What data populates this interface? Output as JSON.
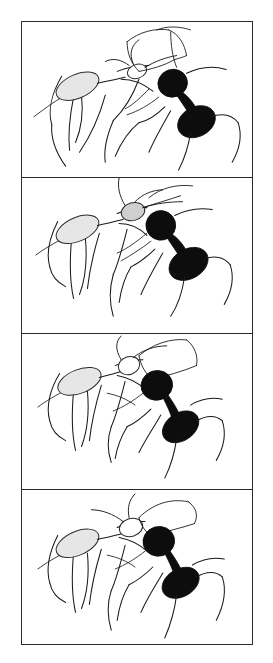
{
  "figure": {
    "caption": "",
    "panel_count": 4,
    "background_color": "#ffffff",
    "border_color": "#2b2b2b",
    "ink_color": "#1a1a1a",
    "dark_ant_fill": "#0d0d0d",
    "light_ant_fill": "#e6e6e6"
  },
  "panels": [
    {
      "id": "panel-1",
      "label": "",
      "description": "Two ants facing each other, dark ant at right rearing up with head and gaster filled black, light ant at left with pale gaster, mandibles locked",
      "dark_ant": {
        "name": "dark-ant",
        "fill": "#0d0d0d",
        "head": {
          "cx": 152,
          "cy": 61,
          "rx": 15,
          "ry": 14,
          "rotation": -22
        },
        "gaster": {
          "cx": 174,
          "cy": 100,
          "rx": 20,
          "ry": 15,
          "rotation": -28
        },
        "petiole": {
          "x1": 158,
          "y1": 74,
          "x2": 168,
          "y2": 90
        }
      },
      "light_ant": {
        "name": "light-ant",
        "fill": "#e6e6e6",
        "gaster": {
          "cx": 56,
          "cy": 65,
          "rx": 22,
          "ry": 12,
          "rotation": -22
        },
        "head": {
          "cx": 116,
          "cy": 52,
          "rx": 9,
          "ry": 8,
          "rotation": -18
        }
      }
    },
    {
      "id": "panel-2",
      "label": "",
      "description": "Dark ant further right and upright, light ant head shaded gray in upper middle, antennae raised",
      "dark_ant": {
        "name": "dark-ant",
        "fill": "#0d0d0d",
        "head": {
          "cx": 140,
          "cy": 48,
          "rx": 15,
          "ry": 15,
          "rotation": -18
        },
        "gaster": {
          "cx": 166,
          "cy": 86,
          "rx": 21,
          "ry": 15,
          "rotation": -30
        }
      },
      "light_ant": {
        "name": "light-ant",
        "fill": "#e6e6e6",
        "gaster": {
          "cx": 54,
          "cy": 52,
          "rx": 22,
          "ry": 12,
          "rotation": -22
        },
        "head": {
          "cx": 112,
          "cy": 34,
          "rx": 11,
          "ry": 9,
          "rotation": -15
        }
      }
    },
    {
      "id": "panel-3",
      "label": "",
      "description": "Dark ant bent forward with gaster lowered, light ant gaster pale at left, legs splayed",
      "dark_ant": {
        "name": "dark-ant",
        "fill": "#0d0d0d",
        "head": {
          "cx": 136,
          "cy": 50,
          "rx": 16,
          "ry": 15,
          "rotation": -20
        },
        "gaster": {
          "cx": 158,
          "cy": 92,
          "rx": 20,
          "ry": 14,
          "rotation": -35
        }
      },
      "light_ant": {
        "name": "light-ant",
        "fill": "#e6e6e6",
        "gaster": {
          "cx": 56,
          "cy": 48,
          "rx": 22,
          "ry": 12,
          "rotation": -20
        },
        "head": {
          "cx": 108,
          "cy": 36,
          "rx": 10,
          "ry": 9,
          "rotation": -18
        }
      }
    },
    {
      "id": "panel-4",
      "label": "",
      "description": "Dark ant leaning in, gaster swung low and left, light ant gaster pale, mandibles engaged",
      "dark_ant": {
        "name": "dark-ant",
        "fill": "#0d0d0d",
        "head": {
          "cx": 138,
          "cy": 48,
          "rx": 16,
          "ry": 15,
          "rotation": -18
        },
        "gaster": {
          "cx": 158,
          "cy": 92,
          "rx": 20,
          "ry": 14,
          "rotation": -32
        }
      },
      "light_ant": {
        "name": "light-ant",
        "fill": "#e6e6e6",
        "gaster": {
          "cx": 54,
          "cy": 52,
          "rx": 22,
          "ry": 12,
          "rotation": -22
        },
        "head": {
          "cx": 110,
          "cy": 36,
          "rx": 11,
          "ry": 9,
          "rotation": -16
        }
      }
    }
  ]
}
